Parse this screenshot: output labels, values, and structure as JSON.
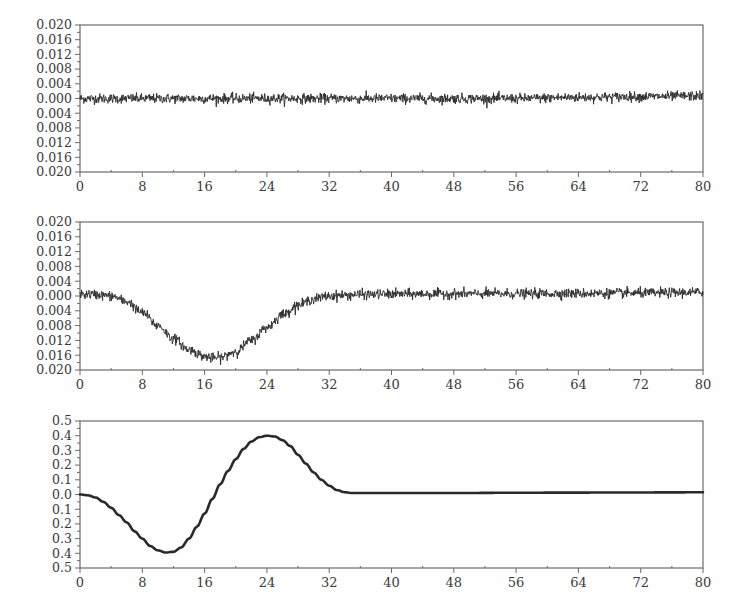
{
  "chart_data": [
    {
      "type": "line",
      "title": "",
      "xlabel": "",
      "ylabel": "",
      "xlim": [
        0,
        80
      ],
      "ylim": [
        -0.02,
        0.02
      ],
      "grid": false,
      "legend": "none",
      "x_ticks": [
        0,
        8,
        16,
        24,
        32,
        40,
        48,
        56,
        64,
        72,
        80
      ],
      "x_tick_labels": [
        "0",
        "8",
        "16",
        "24",
        "32",
        "40",
        "48",
        "56",
        "64",
        "72",
        "80"
      ],
      "y_ticks": [
        0.02,
        0.016,
        0.012,
        0.008,
        0.004,
        0.0,
        -0.004,
        -0.008,
        -0.012,
        -0.016,
        -0.02
      ],
      "y_tick_labels": [
        "0.020",
        "0.016",
        "0.012",
        "0.008",
        "0.004",
        "0.000",
        "0.004",
        "0.008",
        "0.012",
        "0.016",
        "0.020"
      ],
      "series": [
        {
          "name": "noisy signal (near zero)",
          "style": "noisy",
          "noise_amplitude": 0.0012,
          "x": [
            0,
            8,
            16,
            24,
            32,
            40,
            48,
            56,
            64,
            72,
            80
          ],
          "y": [
            0.0,
            0.0,
            0.0,
            0.0,
            0.0,
            0.0,
            0.0,
            0.0,
            0.0003,
            0.0005,
            0.0007
          ]
        }
      ]
    },
    {
      "type": "line",
      "title": "",
      "xlabel": "",
      "ylabel": "",
      "xlim": [
        0,
        80
      ],
      "ylim": [
        -0.02,
        0.02
      ],
      "grid": false,
      "legend": "none",
      "x_ticks": [
        0,
        8,
        16,
        24,
        32,
        40,
        48,
        56,
        64,
        72,
        80
      ],
      "x_tick_labels": [
        "0",
        "8",
        "16",
        "24",
        "32",
        "40",
        "48",
        "56",
        "64",
        "72",
        "80"
      ],
      "y_ticks": [
        0.02,
        0.016,
        0.012,
        0.008,
        0.004,
        0.0,
        -0.004,
        -0.008,
        -0.012,
        -0.016,
        -0.02
      ],
      "y_tick_labels": [
        "0.020",
        "0.016",
        "0.012",
        "0.008",
        "0.004",
        "0.000",
        "0.004",
        "0.008",
        "0.012",
        "0.016",
        "0.020"
      ],
      "series": [
        {
          "name": "noisy signal with dip",
          "style": "noisy",
          "noise_amplitude": 0.0012,
          "x": [
            0,
            2,
            4,
            6,
            8,
            10,
            12,
            14,
            16,
            17,
            18,
            20,
            22,
            24,
            26,
            28,
            30,
            32,
            34,
            36,
            40,
            48,
            56,
            64,
            72,
            80
          ],
          "y": [
            0.0005,
            0.0004,
            0.0,
            -0.0015,
            -0.0045,
            -0.008,
            -0.0115,
            -0.0145,
            -0.0163,
            -0.0168,
            -0.0166,
            -0.015,
            -0.012,
            -0.0085,
            -0.005,
            -0.0025,
            -0.0008,
            0.0,
            0.0002,
            0.0004,
            0.0005,
            0.0006,
            0.0006,
            0.0007,
            0.0008,
            0.001
          ]
        }
      ]
    },
    {
      "type": "line",
      "title": "",
      "xlabel": "",
      "ylabel": "",
      "xlim": [
        0,
        80
      ],
      "ylim": [
        -0.5,
        0.5
      ],
      "grid": false,
      "legend": "none",
      "x_ticks": [
        0,
        8,
        16,
        24,
        32,
        40,
        48,
        56,
        64,
        72,
        80
      ],
      "x_tick_labels": [
        "0",
        "8",
        "16",
        "24",
        "32",
        "40",
        "48",
        "56",
        "64",
        "72",
        "80"
      ],
      "y_ticks": [
        0.5,
        0.4,
        0.3,
        0.2,
        0.1,
        0.0,
        -0.1,
        -0.2,
        -0.3,
        -0.4,
        -0.5
      ],
      "y_tick_labels": [
        "0.5",
        "0.4",
        "0.3",
        "0.2",
        "0.1",
        "0.0",
        "0.1",
        "0.2",
        "0.3",
        "0.4",
        "0.5"
      ],
      "series": [
        {
          "name": "smooth waveform",
          "style": "smooth",
          "x": [
            0,
            1,
            2,
            3,
            4,
            5,
            6,
            7,
            8,
            9,
            10,
            11,
            12,
            13,
            14,
            15,
            16,
            17,
            18,
            19,
            20,
            21,
            22,
            23,
            24,
            25,
            26,
            27,
            28,
            29,
            30,
            31,
            32,
            33,
            34,
            35,
            36,
            40,
            48,
            56,
            64,
            72,
            80
          ],
          "y": [
            0.0,
            -0.005,
            -0.02,
            -0.05,
            -0.09,
            -0.14,
            -0.19,
            -0.25,
            -0.3,
            -0.35,
            -0.38,
            -0.395,
            -0.39,
            -0.36,
            -0.3,
            -0.22,
            -0.13,
            -0.03,
            0.07,
            0.16,
            0.24,
            0.31,
            0.36,
            0.39,
            0.4,
            0.395,
            0.37,
            0.33,
            0.27,
            0.21,
            0.15,
            0.1,
            0.06,
            0.03,
            0.015,
            0.01,
            0.01,
            0.01,
            0.01,
            0.012,
            0.013,
            0.014,
            0.015
          ]
        }
      ]
    }
  ]
}
